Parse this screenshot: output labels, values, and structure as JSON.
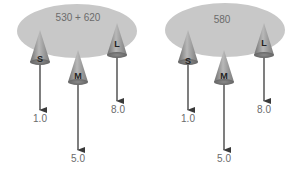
{
  "panels": [
    {
      "light_label": "530 + 620",
      "cones": [
        {
          "label": "S",
          "value": "1.0"
        },
        {
          "label": "M",
          "value": "5.0"
        },
        {
          "label": "L",
          "value": "8.0"
        }
      ]
    },
    {
      "light_label": "580",
      "cones": [
        {
          "label": "S",
          "value": "1.0"
        },
        {
          "label": "M",
          "value": "5.0"
        },
        {
          "label": "L",
          "value": "8.0"
        }
      ]
    }
  ],
  "colors": {
    "ellipse": "#c8c8c8",
    "cone_light": "#b0b0b0",
    "cone_dark": "#6e6e6e",
    "arrow": "#3a3a3a",
    "text": "#6b6b6b"
  }
}
